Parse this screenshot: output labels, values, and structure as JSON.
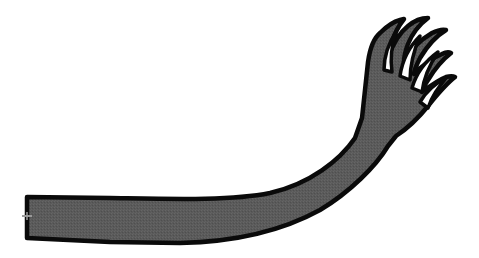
{
  "illustration": {
    "subject": "clawed arm",
    "description": "A long dark-gray cartoon arm extending from the left edge, curving upward to a hand with five claw-like fingers at the upper right",
    "colors": {
      "background": "#ffffff",
      "fill": "#5a5a5a",
      "outline": "#0a0a0a",
      "finger_gap": "#ffffff",
      "marker": "#9a9a9a"
    },
    "parts": {
      "arm": "arm",
      "hand": "hand",
      "fingers": [
        "finger-1",
        "finger-2",
        "finger-3",
        "finger-4",
        "finger-5"
      ],
      "marker": "anchor-marker"
    }
  }
}
